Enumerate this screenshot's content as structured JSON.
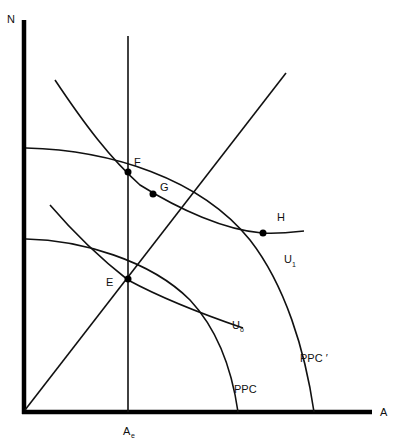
{
  "axes": {
    "y_label": "N",
    "x_label": "A",
    "x_tick_label": "A",
    "x_tick_subscript": "e"
  },
  "curves": {
    "ppc": "PPC",
    "ppc_prime": "PPC ′",
    "u0": "U",
    "u0_sub": "o",
    "u1": "U",
    "u1_sub": "1"
  },
  "points": {
    "E": "E",
    "F": "F",
    "G": "G",
    "H": "H"
  },
  "colors": {
    "ink": "#111111",
    "background": "#ffffff"
  }
}
